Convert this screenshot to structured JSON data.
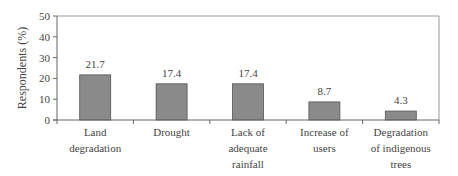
{
  "chart_data": {
    "type": "bar",
    "title": "",
    "xlabel": "",
    "ylabel": "Respondents (%)",
    "ylim": [
      0,
      50
    ],
    "yticks": [
      0,
      10,
      20,
      30,
      40,
      50
    ],
    "grid": false,
    "categories": [
      [
        "Land",
        "degradation"
      ],
      [
        "Drought"
      ],
      [
        "Lack of",
        "adequate",
        "rainfall"
      ],
      [
        "Increase of",
        "users"
      ],
      [
        "Degradation",
        "of indigenous",
        "trees"
      ]
    ],
    "values": [
      21.7,
      17.4,
      17.4,
      8.7,
      4.3
    ],
    "value_labels": [
      "21.7",
      "17.4",
      "17.4",
      "8.7",
      "4.3"
    ],
    "bar_color": "#8a8a8a",
    "bar_edge_color": "#555555"
  }
}
